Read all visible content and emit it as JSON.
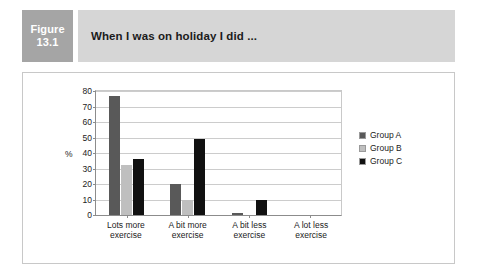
{
  "figure": {
    "label_line1": "Figure",
    "label_line2": "13.1",
    "title": "When I was on holiday I did ...",
    "badge_color": "#a5a5a5",
    "title_bar_color": "#d6d6d6"
  },
  "legend": {
    "items": [
      {
        "label": "Group A",
        "color": "#595959"
      },
      {
        "label": "Group B",
        "color": "#bfbfbf"
      },
      {
        "label": "Group C",
        "color": "#111111"
      }
    ]
  },
  "axis": {
    "y_title": "%",
    "ticks": [
      "80",
      "70",
      "60",
      "50",
      "40",
      "30",
      "20",
      "10",
      "0"
    ]
  },
  "categories_display": [
    {
      "line1": "Lots more",
      "line2": "exercise"
    },
    {
      "line1": "A bit more",
      "line2": "exercise"
    },
    {
      "line1": "A bit less",
      "line2": "exercise"
    },
    {
      "line1": "A lot less",
      "line2": "exercise"
    }
  ],
  "chart_data": {
    "type": "bar",
    "title": "When I was on holiday I did ...",
    "xlabel": "",
    "ylabel": "%",
    "ylim": [
      0,
      80
    ],
    "ytick_step": 10,
    "grid": true,
    "legend_position": "right",
    "categories": [
      "Lots more exercise",
      "A bit more exercise",
      "A bit less exercise",
      "A lot less exercise"
    ],
    "series": [
      {
        "name": "Group A",
        "color": "#595959",
        "values": [
          77,
          20,
          1,
          0
        ]
      },
      {
        "name": "Group B",
        "color": "#bfbfbf",
        "values": [
          32,
          10,
          0,
          0
        ]
      },
      {
        "name": "Group C",
        "color": "#111111",
        "values": [
          36,
          49,
          10,
          0
        ]
      }
    ]
  }
}
